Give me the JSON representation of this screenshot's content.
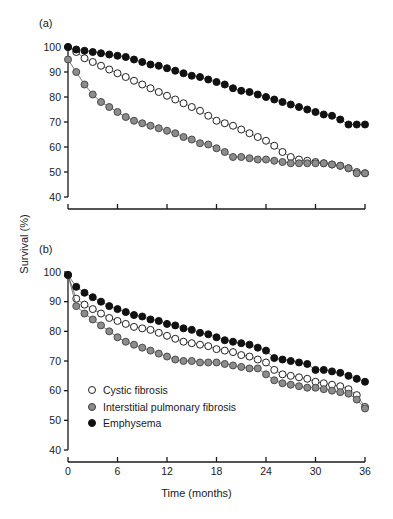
{
  "figure": {
    "panel_a_tag": "(a)",
    "panel_b_tag": "(b)",
    "y_axis_title": "Survival (%)",
    "x_axis_title": "Time (months)"
  },
  "legend": {
    "position": "inside-lower-left-panel-b",
    "items": [
      {
        "marker": "open-circle-marker",
        "label": "Cystic fibrosis",
        "color": "#ffffff"
      },
      {
        "marker": "gray-circle-marker",
        "label": "Interstitial pulmonary fibrosis",
        "color": "#8c8c8c"
      },
      {
        "marker": "black-circle-marker",
        "label": "Emphysema",
        "color": "#111111"
      }
    ]
  },
  "chart_data": [
    {
      "panel": "(a)",
      "type": "line",
      "title": "",
      "xlabel": "Time (months)",
      "ylabel": "Survival (%)",
      "xlim": [
        0,
        36
      ],
      "ylim": [
        40,
        100
      ],
      "xticks": [
        0,
        6,
        12,
        18,
        24,
        30,
        36
      ],
      "xticklabels": [
        "",
        "",
        "",
        "",
        "",
        "",
        ""
      ],
      "yticks": [
        40,
        50,
        60,
        70,
        80,
        90,
        100
      ],
      "yticklabels": [
        "40",
        "50",
        "60",
        "70",
        "80",
        "90",
        "100"
      ],
      "grid": false,
      "legend_position": "none",
      "x": [
        0,
        1,
        2,
        3,
        4,
        5,
        6,
        7,
        8,
        9,
        10,
        11,
        12,
        13,
        14,
        15,
        16,
        17,
        18,
        19,
        20,
        21,
        22,
        23,
        24,
        25,
        26,
        27,
        28,
        29,
        30,
        31,
        32,
        33,
        34,
        35,
        36
      ],
      "series": [
        {
          "name": "Cystic fibrosis",
          "marker": "open-circle-marker",
          "color": "#ffffff",
          "values": [
            100.0,
            98.0,
            95.5,
            94.0,
            92.5,
            91.0,
            89.5,
            88.0,
            86.5,
            85.0,
            83.5,
            82.0,
            80.5,
            79.0,
            77.5,
            76.0,
            74.5,
            72.5,
            70.5,
            69.5,
            68.5,
            67.0,
            65.5,
            64.0,
            62.5,
            60.5,
            58.0,
            56.0,
            55.0,
            54.5,
            54.0,
            53.5,
            53.0,
            52.5,
            51.5,
            50.0,
            49.5
          ]
        },
        {
          "name": "Interstitial pulmonary fibrosis",
          "marker": "gray-circle-marker",
          "color": "#8c8c8c",
          "values": [
            95.0,
            90.0,
            85.0,
            81.0,
            78.0,
            76.0,
            74.0,
            72.0,
            70.5,
            69.5,
            68.5,
            67.5,
            66.5,
            65.5,
            64.0,
            63.0,
            61.5,
            61.0,
            59.5,
            58.0,
            56.0,
            56.0,
            55.5,
            55.0,
            55.0,
            54.5,
            54.0,
            53.5,
            53.5,
            53.5,
            53.5,
            53.5,
            53.0,
            52.5,
            51.5,
            49.5,
            49.5
          ]
        },
        {
          "name": "Emphysema",
          "marker": "black-circle-marker",
          "color": "#111111",
          "values": [
            100.0,
            99.0,
            98.5,
            98.0,
            97.5,
            97.0,
            96.5,
            96.0,
            95.0,
            94.0,
            93.0,
            92.5,
            91.5,
            90.5,
            89.5,
            88.5,
            88.0,
            87.0,
            86.0,
            85.0,
            83.5,
            82.5,
            82.0,
            81.0,
            80.0,
            79.0,
            78.0,
            77.0,
            76.0,
            75.0,
            74.0,
            73.0,
            72.5,
            71.0,
            69.0,
            69.0,
            69.0
          ]
        }
      ]
    },
    {
      "panel": "(b)",
      "type": "line",
      "title": "",
      "xlabel": "Time (months)",
      "ylabel": "Survival (%)",
      "xlim": [
        0,
        36
      ],
      "ylim": [
        40,
        100
      ],
      "xticks": [
        0,
        6,
        12,
        18,
        24,
        30,
        36
      ],
      "xticklabels": [
        "0",
        "6",
        "12",
        "18",
        "24",
        "30",
        "36"
      ],
      "yticks": [
        40,
        50,
        60,
        70,
        80,
        90,
        100
      ],
      "yticklabels": [
        "40",
        "50",
        "60",
        "70",
        "80",
        "90",
        "100"
      ],
      "grid": false,
      "legend_position": "lower-left",
      "x": [
        0,
        1,
        2,
        3,
        4,
        5,
        6,
        7,
        8,
        9,
        10,
        11,
        12,
        13,
        14,
        15,
        16,
        17,
        18,
        19,
        20,
        21,
        22,
        23,
        24,
        25,
        26,
        27,
        28,
        29,
        30,
        31,
        32,
        33,
        34,
        35,
        36
      ],
      "series": [
        {
          "name": "Cystic fibrosis",
          "marker": "open-circle-marker",
          "color": "#ffffff",
          "values": [
            99.0,
            91.0,
            89.0,
            87.5,
            86.0,
            84.5,
            83.5,
            82.5,
            81.5,
            81.0,
            80.5,
            79.5,
            78.5,
            77.5,
            76.5,
            76.0,
            75.5,
            75.0,
            74.0,
            73.5,
            73.0,
            72.0,
            71.5,
            70.5,
            69.5,
            67.0,
            65.5,
            65.0,
            64.5,
            64.0,
            63.0,
            62.5,
            62.0,
            61.5,
            60.5,
            58.5,
            54.5
          ]
        },
        {
          "name": "Interstitial pulmonary fibrosis",
          "marker": "gray-circle-marker",
          "color": "#8c8c8c",
          "values": [
            99.0,
            88.5,
            86.0,
            84.0,
            82.0,
            80.0,
            78.0,
            76.5,
            75.5,
            74.5,
            73.5,
            72.5,
            71.5,
            70.5,
            70.0,
            70.0,
            69.5,
            69.5,
            69.5,
            69.0,
            68.5,
            68.0,
            67.5,
            67.5,
            65.5,
            63.5,
            62.5,
            62.0,
            61.5,
            61.0,
            61.0,
            60.5,
            60.0,
            59.5,
            59.0,
            57.0,
            54.0
          ]
        },
        {
          "name": "Emphysema",
          "marker": "black-circle-marker",
          "color": "#111111",
          "values": [
            99.0,
            95.0,
            93.0,
            91.5,
            90.0,
            88.5,
            87.5,
            86.5,
            85.5,
            85.0,
            84.0,
            83.5,
            82.5,
            82.0,
            81.0,
            80.5,
            79.5,
            79.0,
            78.0,
            77.0,
            76.5,
            76.0,
            75.5,
            74.5,
            73.5,
            71.0,
            70.5,
            70.0,
            69.5,
            69.0,
            67.0,
            67.0,
            66.5,
            66.0,
            65.0,
            64.0,
            63.0
          ]
        }
      ]
    }
  ]
}
